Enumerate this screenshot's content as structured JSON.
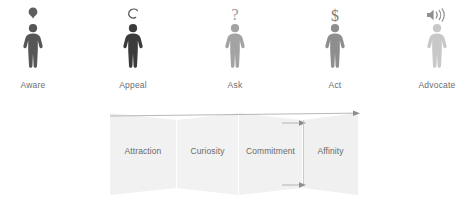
{
  "diagram": {
    "stages": [
      {
        "label": "Aware",
        "icon": "lightbulb-pin-icon",
        "figure_icon": "person-figure-icon",
        "color": "#595959",
        "glyph_color": "#595959"
      },
      {
        "label": "Appeal",
        "icon": "crescent-c-icon",
        "figure_icon": "person-figure-icon",
        "color": "#3f3f3f",
        "glyph_color": "#5a5a5a"
      },
      {
        "label": "Ask",
        "icon": "question-mark-icon",
        "figure_icon": "person-figure-icon",
        "color": "#a3a3a3",
        "glyph_color": "#9a9a9a"
      },
      {
        "label": "Act",
        "icon": "dollar-sign-icon",
        "figure_icon": "person-figure-icon",
        "color": "#8e8e8e",
        "glyph_color": "#7e7e7e"
      },
      {
        "label": "Advocate",
        "icon": "speaker-sound-icon",
        "figure_icon": "person-figure-icon",
        "color": "#c8c8c8",
        "glyph_color": "#a0a0a0"
      }
    ],
    "funnel": {
      "segments": [
        {
          "label": "Attraction",
          "fill": "#f1f1f1"
        },
        {
          "label": "Curiosity",
          "fill": "#f2f2f2"
        },
        {
          "label": "Commitment",
          "fill": "#f1f1f1"
        },
        {
          "label": "Affinity",
          "fill": "#f0f0f0"
        }
      ],
      "arrows": [
        {
          "name": "funnel-arrow-top",
          "direction": "right"
        },
        {
          "name": "funnel-arrow-mid-upper",
          "direction": "right"
        },
        {
          "name": "funnel-arrow-mid-lower",
          "direction": "right"
        }
      ],
      "arrow_color": "#9a9a9a"
    }
  }
}
